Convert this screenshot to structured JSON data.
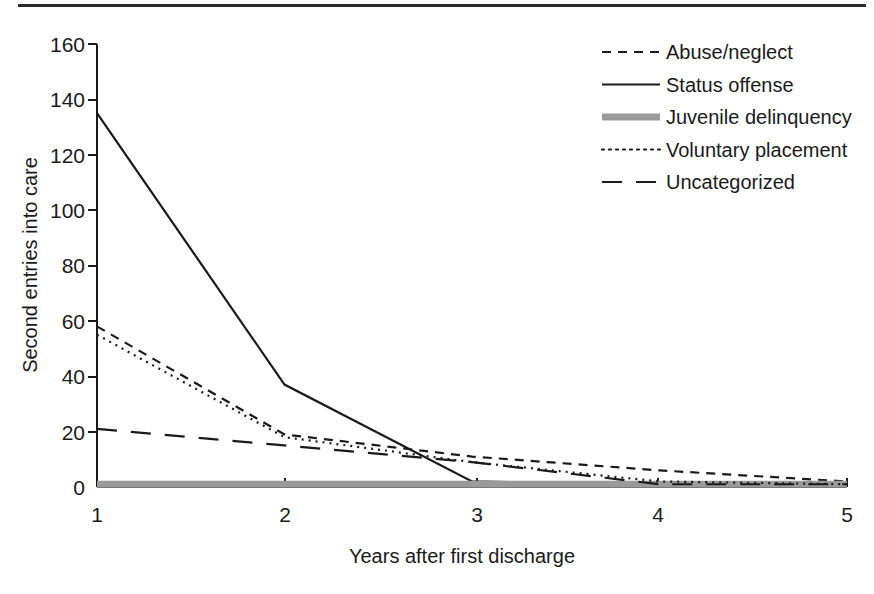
{
  "figure": {
    "top_rule": "horizontal-rule",
    "background_color": "#ffffff",
    "ink_color": "#1a1a1a"
  },
  "chart_data": {
    "type": "line",
    "title": "",
    "xlabel": "Years after first discharge",
    "ylabel": "Second entries into care",
    "x": [
      1,
      2,
      3,
      4,
      5
    ],
    "xticklabels": [
      "1",
      "2",
      "3",
      "4",
      "5"
    ],
    "yticks": [
      0,
      20,
      40,
      60,
      80,
      100,
      120,
      140,
      160
    ],
    "yticklabels": [
      "0",
      "20",
      "40",
      "60",
      "80",
      "100",
      "120",
      "140",
      "160"
    ],
    "xlim": [
      1,
      5
    ],
    "ylim": [
      0,
      160
    ],
    "grid": false,
    "legend_position": "upper right",
    "series": [
      {
        "name": "Abuse/neglect",
        "values": [
          58,
          19,
          11,
          6,
          2
        ],
        "style": "short-dash",
        "color": "#1a1a1a",
        "width": 2.2,
        "dash": "9,7"
      },
      {
        "name": "Status offense",
        "values": [
          135,
          37,
          2,
          1,
          1
        ],
        "style": "solid",
        "color": "#1a1a1a",
        "width": 2.2,
        "dash": "none"
      },
      {
        "name": "Juvenile delinquency",
        "values": [
          1,
          1,
          1,
          1,
          1
        ],
        "style": "thick-gray-solid",
        "color": "#9a9a9a",
        "width": 7,
        "dash": "none"
      },
      {
        "name": "Voluntary placement",
        "values": [
          55,
          18,
          9,
          2,
          1
        ],
        "style": "dotted",
        "color": "#1a1a1a",
        "width": 2.2,
        "dash": "2,5"
      },
      {
        "name": "Uncategorized",
        "values": [
          21,
          15,
          9,
          1,
          1
        ],
        "style": "long-dash",
        "color": "#1a1a1a",
        "width": 2.2,
        "dash": "20,14"
      }
    ]
  },
  "legend": {
    "items": [
      {
        "label": "Abuse/neglect",
        "swatch": "short-dash-swatch"
      },
      {
        "label": "Status offense",
        "swatch": "solid-swatch"
      },
      {
        "label": "Juvenile delinquency",
        "swatch": "thick-gray-swatch"
      },
      {
        "label": "Voluntary placement",
        "swatch": "dotted-swatch"
      },
      {
        "label": "Uncategorized",
        "swatch": "long-dash-swatch"
      }
    ]
  }
}
